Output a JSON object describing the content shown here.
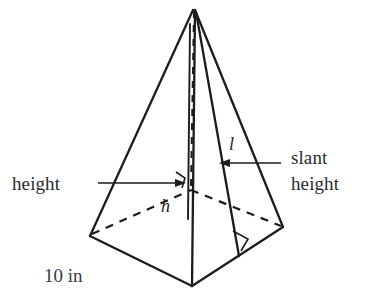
{
  "figure": {
    "shape_name": "square-pyramid",
    "background_color": "#ffffff",
    "ink_color": "#1c1c1c",
    "text_color": "#2a2a2e"
  },
  "labels": {
    "height_label": "height",
    "slant_label_line1": "slant",
    "slant_label_line2": "height",
    "base_edge_label": "10 in",
    "height_variable": "h",
    "slant_variable": "l"
  },
  "geometry": {
    "apex": {
      "x": 194,
      "y": 9
    },
    "base_front": {
      "x": 192,
      "y": 286
    },
    "base_left": {
      "x": 90,
      "y": 236
    },
    "base_right": {
      "x": 283,
      "y": 227
    },
    "base_back": {
      "x": 191,
      "y": 189
    },
    "base_center": {
      "x": 190,
      "y": 219
    },
    "height_foot": {
      "x": 188,
      "y": 219
    },
    "slant_foot": {
      "x": 239,
      "y": 256
    }
  },
  "annotations": {
    "height_arrow": {
      "from_x": 98,
      "to_x": 181,
      "y": 183
    },
    "slant_arrow": {
      "from_x": 281,
      "to_x": 221,
      "y": 163
    },
    "right_angle_base": {
      "x": 176,
      "y": 170
    },
    "right_angle_slant": {
      "x": 236,
      "y": 228
    }
  },
  "measurements": {
    "base_edge_length": "10",
    "base_edge_unit": "in"
  }
}
